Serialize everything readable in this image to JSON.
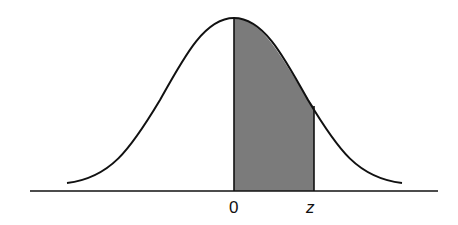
{
  "diagram": {
    "type": "standard-normal-curve",
    "labels": {
      "zero": "0",
      "z": "z"
    },
    "shaded_region": {
      "from": "0",
      "to": "z"
    },
    "colors": {
      "curve": "#111111",
      "axis": "#111111",
      "shade": "#7b7b7b",
      "background": "#ffffff"
    }
  }
}
